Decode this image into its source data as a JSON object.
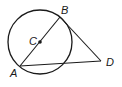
{
  "diagram": {
    "type": "geometry",
    "circle": {
      "center_label": "C",
      "cx": 40,
      "cy": 42,
      "r": 32
    },
    "points": {
      "A": {
        "label": "A",
        "x": 20,
        "y": 66
      },
      "B": {
        "label": "B",
        "x": 60,
        "y": 17
      },
      "C": {
        "label": "C",
        "x": 40,
        "y": 42
      },
      "D": {
        "label": "D",
        "x": 101,
        "y": 61
      }
    },
    "segments": [
      {
        "from": "A",
        "to": "B",
        "note": "diameter through C"
      },
      {
        "from": "B",
        "to": "D"
      },
      {
        "from": "A",
        "to": "D"
      }
    ],
    "colors": {
      "stroke": "#1a1a1a",
      "background": "#ffffff"
    }
  }
}
